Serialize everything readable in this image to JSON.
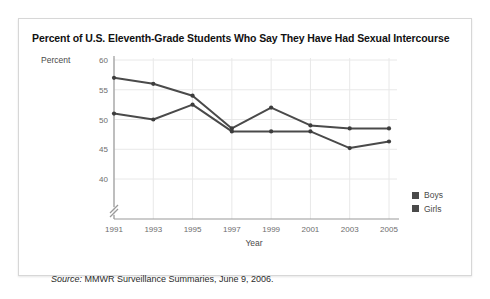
{
  "figure": {
    "title": "Percent of U.S. Eleventh-Grade Students Who Say They Have Had Sexual Intercourse",
    "source_label": "Source:",
    "source_text": " MMWR Surveillance Summaries, June 9, 2006."
  },
  "chart_data": {
    "type": "line",
    "title": "Percent of U.S. Eleventh-Grade Students Who Say They Have Had Sexual Intercourse",
    "xlabel": "Year",
    "ylabel": "Percent",
    "categories": [
      "1991",
      "1993",
      "1995",
      "1997",
      "1999",
      "2001",
      "2003",
      "2005"
    ],
    "x": [
      1991,
      1993,
      1995,
      1997,
      1999,
      2001,
      2003,
      2005
    ],
    "series": [
      {
        "name": "Boys",
        "color": "#4a4a4a",
        "values": [
          57,
          56,
          54,
          48.5,
          52,
          49,
          48.5,
          48.5
        ]
      },
      {
        "name": "Girls",
        "color": "#4a4a4a",
        "values": [
          51,
          50,
          52.5,
          48,
          48,
          48,
          45.2,
          46.3
        ]
      }
    ],
    "ylim": [
      38,
      60
    ],
    "yticks": [
      40,
      45,
      50,
      55,
      60
    ],
    "ytick_labels": [
      "40",
      "45",
      "50",
      "55",
      "60"
    ],
    "axis_break": true,
    "grid": true,
    "legend_position": "right"
  },
  "legend": {
    "items": [
      {
        "label": "Boys",
        "color": "#4a4a4a"
      },
      {
        "label": "Girls",
        "color": "#4a4a4a"
      }
    ]
  },
  "colors": {
    "line": "#4a4a4a",
    "grid": "#e8e8e8",
    "axis": "#9a9a9a",
    "text": "#2b2b2b",
    "tick_text": "#6d6d6d",
    "card_border": "#d7d7d7"
  }
}
